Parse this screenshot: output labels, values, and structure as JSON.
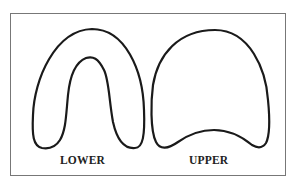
{
  "figure": {
    "shapes": [
      {
        "id": "lower",
        "label": "LOWER",
        "description": "horseshoe-shaped lower arch outline"
      },
      {
        "id": "upper",
        "label": "UPPER",
        "description": "dome-shaped upper arch outline"
      }
    ],
    "colors": {
      "stroke": "#1a1a1a",
      "frame": "#777777",
      "background": "#ffffff"
    }
  }
}
